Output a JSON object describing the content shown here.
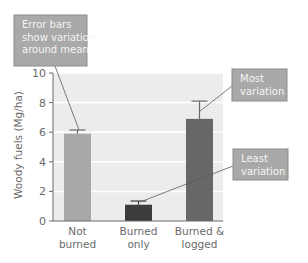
{
  "chart_data": {
    "type": "bar",
    "title": "",
    "xlabel": "",
    "ylabel": "Woody fuels (Mg/ha)",
    "ylim": [
      0,
      10
    ],
    "yticks": [
      0,
      2,
      4,
      6,
      8,
      10
    ],
    "grid": true,
    "categories": [
      "Not burned",
      "Burned only",
      "Burned & logged"
    ],
    "category_lines": [
      [
        "Not",
        "burned"
      ],
      [
        "Burned",
        "only"
      ],
      [
        "Burned &",
        "logged"
      ]
    ],
    "values": [
      5.9,
      1.1,
      6.9
    ],
    "errors": [
      0.25,
      0.25,
      1.2
    ],
    "colors": [
      "#a8a8a8",
      "#3c3c3c",
      "#676767"
    ],
    "annotations": [
      {
        "lines": [
          "Error bars",
          "show variation",
          "around mean"
        ],
        "points_to": "Not burned error bar"
      },
      {
        "lines": [
          "Most",
          "variation"
        ],
        "points_to": "Burned & logged error bar"
      },
      {
        "lines": [
          "Least",
          "variation"
        ],
        "points_to": "Burned only error bar"
      }
    ]
  },
  "style": {
    "plot_background": "#ececec",
    "gridline": "#ffffff",
    "axis": "#6a6a6a",
    "callout_fill": "#a9a9a9",
    "callout_border": "#8c8c8c"
  }
}
